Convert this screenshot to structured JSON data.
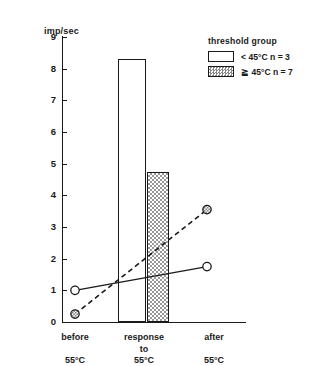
{
  "chart_data": {
    "type": "bar",
    "title": "",
    "ylabel": "imp/sec",
    "xlabel": "",
    "ylim": [
      0,
      9
    ],
    "yticks": [
      0,
      1,
      2,
      3,
      4,
      5,
      6,
      7,
      8,
      9
    ],
    "grid": false,
    "categories": [
      "before 55°C",
      "response to 55°C",
      "after 55°C"
    ],
    "category_lines": [
      [
        "before",
        "55°C"
      ],
      [
        "response",
        "to",
        "55°C"
      ],
      [
        "after",
        "55°C"
      ]
    ],
    "bars": [
      {
        "name": "< 45°C n = 3",
        "category": "response to 55°C",
        "value": 8.3,
        "style": "open"
      },
      {
        "name": "≧ 45°C n = 7",
        "category": "response to 55°C",
        "value": 4.75,
        "style": "hatched"
      }
    ],
    "series": [
      {
        "name": "< 45°C n = 3",
        "style": "solid",
        "marker": "open-circle",
        "x": [
          "before 55°C",
          "after 55°C"
        ],
        "values": [
          1.0,
          1.75
        ]
      },
      {
        "name": "≧ 45°C n = 7",
        "style": "dashed",
        "marker": "hatched-circle",
        "x": [
          "before 55°C",
          "after 55°C"
        ],
        "values": [
          0.25,
          3.55
        ]
      }
    ],
    "legend": {
      "position": "top-right",
      "title": "threshold  group",
      "entries": [
        {
          "label": "<  45°C   n = 3",
          "style": "open"
        },
        {
          "label": "≧  45°C   n = 7",
          "style": "hatched"
        }
      ]
    },
    "colors": {
      "line": "#1a1a1a",
      "bar_fill_open": "#ffffff",
      "bar_fill_hatched": "#c9c9c9"
    }
  },
  "axis": {
    "y_label": "imp/sec",
    "y_tick_labels": [
      "9",
      "8",
      "7",
      "6",
      "5",
      "4",
      "3",
      "2",
      "1",
      "0"
    ]
  },
  "xlabels": {
    "c1_l1": "before",
    "c1_l2": "55°C",
    "c2_l1": "response",
    "c2_l2": "to",
    "c2_l3": "55°C",
    "c3_l1": "after",
    "c3_l2": "55°C"
  },
  "legend": {
    "title": "threshold  group",
    "entry1": "<  45°C   n = 3",
    "entry2": "≧  45°C   n = 7"
  }
}
